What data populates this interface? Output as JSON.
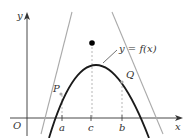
{
  "diagram": {
    "axis_labels": {
      "x": "x",
      "y": "y",
      "origin": "O"
    },
    "tick_labels": {
      "a": "a",
      "c": "c",
      "b": "b"
    },
    "points": {
      "P": "P",
      "Q": "Q"
    },
    "curve_label": "y = f(x)",
    "colors": {
      "curve": "#1a1a1a",
      "tangent": "#aaaaaa",
      "axis": "#333333",
      "dashed": "#999999",
      "intersection": "#000000"
    }
  }
}
